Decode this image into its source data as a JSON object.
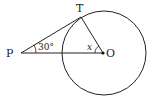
{
  "diagram": {
    "type": "geometry",
    "points": {
      "P": {
        "label": "P",
        "x": 21,
        "y": 53
      },
      "T": {
        "label": "T",
        "x": 81,
        "y": 17
      },
      "O": {
        "label": "O",
        "x": 103,
        "y": 53
      }
    },
    "circle": {
      "cx": 104,
      "cy": 52,
      "r": 42
    },
    "angles": {
      "P": {
        "label": "30°"
      },
      "O": {
        "label": "x"
      }
    },
    "colors": {
      "stroke": "#222222",
      "background": "#ffffff"
    }
  }
}
